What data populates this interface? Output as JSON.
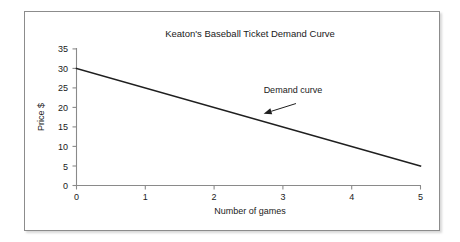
{
  "figure": {
    "frame": {
      "border_color": "#8c8c8c",
      "background_color": "#ffffff"
    }
  },
  "chart_data": {
    "type": "line",
    "title": "Keaton's Baseball Ticket Demand Curve",
    "xlabel": "Number of games",
    "ylabel": "Price $",
    "xlim": [
      0,
      5
    ],
    "ylim": [
      0,
      35
    ],
    "grid": false,
    "legend": null,
    "xticks": [
      "0",
      "1",
      "2",
      "3",
      "4",
      "5"
    ],
    "yticks": [
      "0",
      "5",
      "10",
      "15",
      "20",
      "25",
      "30",
      "35"
    ],
    "xtick_values": [
      0,
      1,
      2,
      3,
      4,
      5
    ],
    "ytick_values": [
      0,
      5,
      10,
      15,
      20,
      25,
      30,
      35
    ],
    "series": [
      {
        "name": "Demand curve",
        "color": "#1f1f1f",
        "x": [
          0,
          5
        ],
        "y": [
          30,
          5
        ]
      }
    ],
    "annotations": [
      {
        "text": "Demand curve",
        "text_x": 2.72,
        "text_y": 23.8,
        "arrow_from_x": 3.19,
        "arrow_from_y": 21.0,
        "arrow_to_x": 2.72,
        "arrow_to_y": 18.4
      }
    ]
  }
}
